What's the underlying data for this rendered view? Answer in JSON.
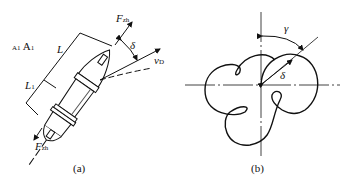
{
  "figure_a": {
    "caption": "(a)",
    "labels": {
      "section_small": "A1",
      "section": "A",
      "section_sub": "1",
      "L": "L",
      "L1": "L",
      "L1_sub": "1",
      "F_top": "F",
      "F_top_sub": "zh",
      "F_bottom": "F",
      "F_bottom_sub": "zh",
      "delta": "δ",
      "vD": "v",
      "vD_sub": "D"
    }
  },
  "figure_b": {
    "caption": "(b)",
    "labels": {
      "gamma": "γ",
      "delta": "δ"
    }
  },
  "colors": {
    "stroke": "#111111",
    "background": "#ffffff"
  }
}
